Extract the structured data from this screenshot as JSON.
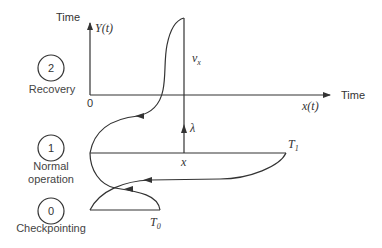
{
  "diagram": {
    "type": "state-transition-with-time-axes",
    "axes": {
      "y_axis_label": "Time",
      "y_axis_function": "Y(t)",
      "x_axis_label": "Time",
      "x_axis_function": "x(t)",
      "origin_label": "0"
    },
    "states": [
      {
        "number": "2",
        "label_line1": "Recovery",
        "label_line2": ""
      },
      {
        "number": "1",
        "label_line1": "Normal",
        "label_line2": "operation"
      },
      {
        "number": "0",
        "label_line1": "Checkpointing",
        "label_line2": ""
      }
    ],
    "annotations": {
      "vx": "v",
      "vx_sub": "x",
      "lambda": "λ",
      "x": "x",
      "T1": "T",
      "T1_sub": "1",
      "T0": "T",
      "T0_sub": "0"
    },
    "colors": {
      "line": "#333333",
      "text": "#333333",
      "background": "#ffffff"
    }
  }
}
